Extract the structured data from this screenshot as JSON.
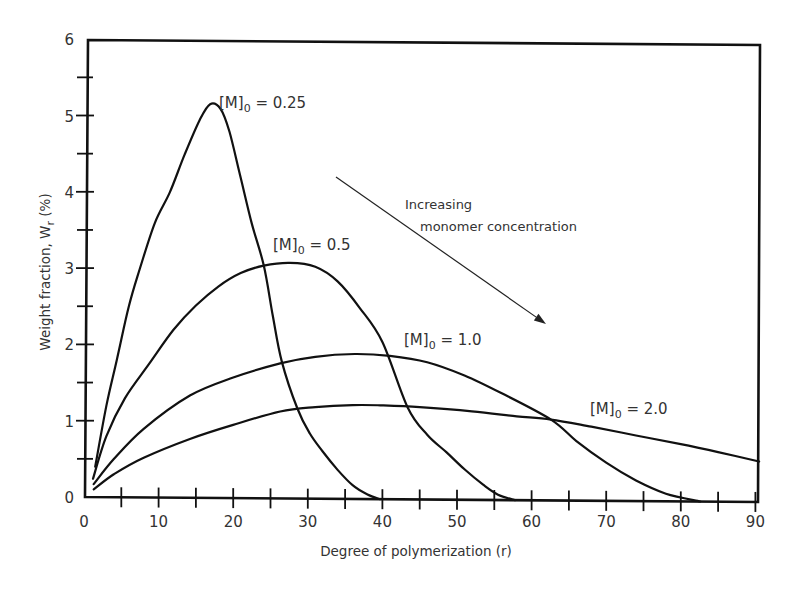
{
  "chart_data": {
    "type": "line",
    "title": "",
    "xlabel": "Degree of polymerization (r)",
    "ylabel": "Weight fraction, W_r (%)",
    "ylabel_main": "Weight fraction, W",
    "ylabel_sub": "r",
    "ylabel_tail": " (%)",
    "xlim": [
      0,
      91
    ],
    "ylim": [
      0,
      6
    ],
    "x_ticks": [
      0,
      10,
      20,
      30,
      40,
      50,
      60,
      70,
      80,
      90
    ],
    "x_minor_ticks": [
      5,
      15,
      25,
      35,
      45,
      55,
      65,
      75,
      85
    ],
    "y_ticks": [
      0,
      1,
      2,
      3,
      4,
      5,
      6
    ],
    "y_minor_ticks": [
      0.5,
      1.5,
      2.5,
      3.5,
      4.5,
      5.5
    ],
    "grid": false,
    "legend": "inline labels",
    "series": [
      {
        "name": "[M]0 = 0.25",
        "label_prefix": "[M]",
        "label_sub": "0",
        "label_value": "= 0.25",
        "label_pos": [
          219,
          108
        ],
        "points": [
          [
            1.5,
            0.4
          ],
          [
            3,
            1.2
          ],
          [
            4.4,
            1.8
          ],
          [
            6,
            2.5
          ],
          [
            7.5,
            3.0
          ],
          [
            9.5,
            3.6
          ],
          [
            11.5,
            4.0
          ],
          [
            13.5,
            4.5
          ],
          [
            15.5,
            4.95
          ],
          [
            16.9,
            5.16
          ],
          [
            18.3,
            5.1
          ],
          [
            19.5,
            4.8
          ],
          [
            21,
            4.2
          ],
          [
            22.5,
            3.6
          ],
          [
            24.1,
            3.05
          ],
          [
            25.3,
            2.4
          ],
          [
            26.5,
            1.8
          ],
          [
            28.6,
            1.18
          ],
          [
            30.3,
            0.85
          ],
          [
            32,
            0.62
          ],
          [
            34,
            0.38
          ],
          [
            36,
            0.18
          ],
          [
            38,
            0.06
          ],
          [
            39.7,
            0.0
          ]
        ]
      },
      {
        "name": "[M]0 = 0.5",
        "label_prefix": "[M]",
        "label_sub": "0",
        "label_value": "= 0.5",
        "label_pos": [
          273,
          250
        ],
        "points": [
          [
            1.2,
            0.24
          ],
          [
            3,
            0.8
          ],
          [
            5.5,
            1.3
          ],
          [
            8.8,
            1.76
          ],
          [
            12,
            2.2
          ],
          [
            15,
            2.52
          ],
          [
            18,
            2.77
          ],
          [
            21,
            2.95
          ],
          [
            24.1,
            3.05
          ],
          [
            27.6,
            3.09
          ],
          [
            31,
            3.04
          ],
          [
            34,
            2.85
          ],
          [
            37,
            2.5
          ],
          [
            40,
            2.06
          ],
          [
            43.4,
            1.2
          ],
          [
            46,
            0.85
          ],
          [
            48.6,
            0.62
          ],
          [
            51,
            0.4
          ],
          [
            53.5,
            0.2
          ],
          [
            55.5,
            0.07
          ],
          [
            57.8,
            0.0
          ]
        ]
      },
      {
        "name": "[M]0 = 1.0",
        "label_prefix": "[M]",
        "label_sub": "0",
        "label_value": "= 1.0",
        "label_pos": [
          404,
          345
        ],
        "points": [
          [
            1.3,
            0.17
          ],
          [
            4,
            0.5
          ],
          [
            8,
            0.9
          ],
          [
            14.2,
            1.34
          ],
          [
            20,
            1.58
          ],
          [
            26.3,
            1.77
          ],
          [
            31,
            1.86
          ],
          [
            36.3,
            1.9
          ],
          [
            41,
            1.88
          ],
          [
            46,
            1.8
          ],
          [
            51,
            1.63
          ],
          [
            56,
            1.4
          ],
          [
            62.6,
            1.06
          ],
          [
            66,
            0.78
          ],
          [
            70,
            0.5
          ],
          [
            74,
            0.27
          ],
          [
            78,
            0.1
          ],
          [
            82.6,
            0.0
          ]
        ]
      },
      {
        "name": "[M]0 = 2.0",
        "label_prefix": "[M]",
        "label_sub": "0",
        "label_value": "= 2.0",
        "label_pos": [
          590,
          414
        ],
        "points": [
          [
            1.3,
            0.1
          ],
          [
            4,
            0.3
          ],
          [
            8,
            0.52
          ],
          [
            14.2,
            0.77
          ],
          [
            20,
            0.96
          ],
          [
            26.3,
            1.14
          ],
          [
            31,
            1.2
          ],
          [
            36,
            1.23
          ],
          [
            39.7,
            1.23
          ],
          [
            45,
            1.21
          ],
          [
            52,
            1.16
          ],
          [
            58,
            1.1
          ],
          [
            62.6,
            1.06
          ],
          [
            68,
            0.97
          ],
          [
            74,
            0.86
          ],
          [
            80,
            0.75
          ],
          [
            85,
            0.65
          ],
          [
            90.5,
            0.53
          ]
        ]
      }
    ],
    "annotations": [
      {
        "text_line1": "Increasing",
        "text_line2": "monomer concentration",
        "arrow_from": [
          336,
          177
        ],
        "arrow_to": [
          546,
          324
        ]
      }
    ]
  }
}
